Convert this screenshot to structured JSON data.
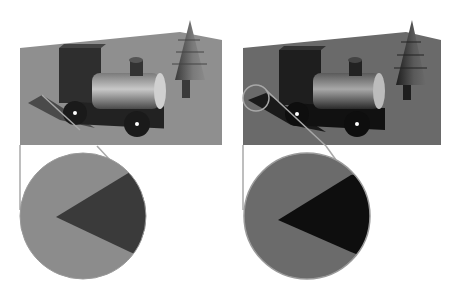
{
  "figure": {
    "panels": [
      {
        "id": "left",
        "floor_color": "#8f8f8f",
        "wall_color": "#9a9a9a",
        "inset_bg": "#8c8c8c",
        "inset_shadow": "#3a3a3a",
        "connector_color": "#a8a8a8"
      },
      {
        "id": "right",
        "floor_color": "#6a6a6a",
        "wall_color": "#747474",
        "inset_bg": "#6b6b6b",
        "inset_shadow": "#0e0e0e",
        "connector_color": "#a8a8a8"
      }
    ]
  }
}
